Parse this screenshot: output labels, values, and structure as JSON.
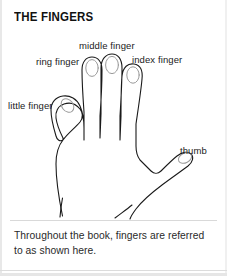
{
  "page": {
    "title": "THE FINGERS",
    "background_color": "#ffffff",
    "ink_color": "#1a1a1a",
    "width": 227,
    "height": 276
  },
  "figure": {
    "name": "hand-outline-diagram",
    "labels": {
      "middle": "middle finger",
      "ring": "ring finger",
      "index": "index finger",
      "little": "little finger",
      "thumb": "thumb"
    }
  },
  "caption": {
    "text": "Throughout the book, fingers are referred to as shown here."
  }
}
